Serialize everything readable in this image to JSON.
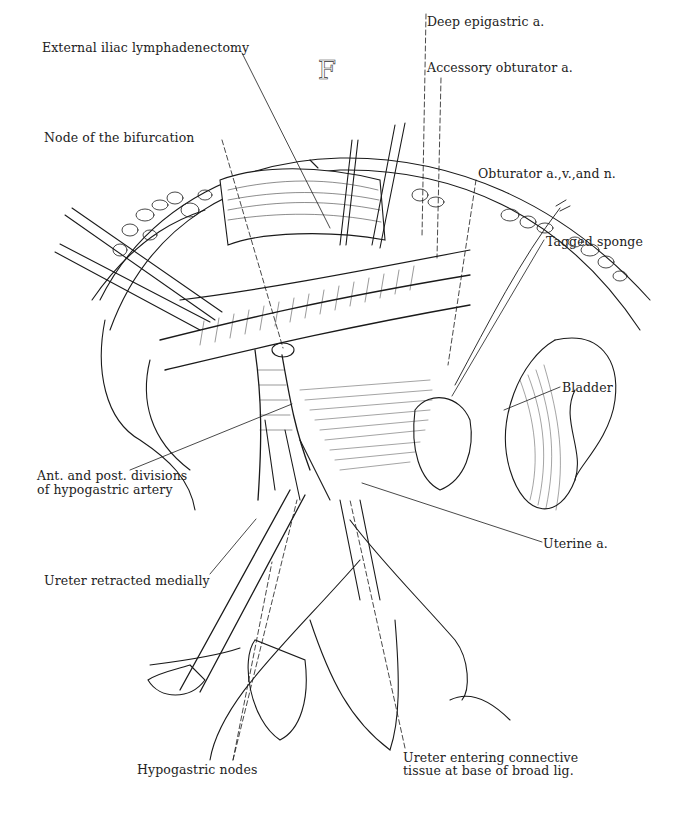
{
  "figure": {
    "panel_letter": "F",
    "labels": [
      {
        "id": "external-iliac-lymphadenectomy",
        "text": "External iliac lymphadenectomy",
        "x": 42,
        "y": 41
      },
      {
        "id": "node-of-bifurcation",
        "text": "Node of the bifurcation",
        "x": 44,
        "y": 131
      },
      {
        "id": "deep-epigastric-a",
        "text": "Deep epigastric a.",
        "x": 427,
        "y": 15
      },
      {
        "id": "accessory-obturator-a",
        "text": "Accessory obturator a.",
        "x": 427,
        "y": 61
      },
      {
        "id": "obturator-avn",
        "text": "Obturator a.,v.,and n.",
        "x": 478,
        "y": 167
      },
      {
        "id": "tagged-sponge",
        "text": "Tagged sponge",
        "x": 546,
        "y": 235
      },
      {
        "id": "bladder",
        "text": "Bladder",
        "x": 562,
        "y": 381
      },
      {
        "id": "ant-post-divisions",
        "text": "Ant. and post. divisions",
        "x": 37,
        "y": 469
      },
      {
        "id": "of-hypogastric-artery",
        "text": "of hypogastric artery",
        "x": 37,
        "y": 483
      },
      {
        "id": "uterine-a",
        "text": "Uterine a.",
        "x": 543,
        "y": 537
      },
      {
        "id": "ureter-retracted-medially",
        "text": "Ureter retracted medially",
        "x": 44,
        "y": 574
      },
      {
        "id": "hypogastric-nodes",
        "text": "Hypogastric nodes",
        "x": 137,
        "y": 763
      },
      {
        "id": "ureter-entering-1",
        "text": "Ureter entering connective",
        "x": 403,
        "y": 751
      },
      {
        "id": "ureter-entering-2",
        "text": "tissue at base of broad lig.",
        "x": 403,
        "y": 764
      }
    ],
    "leader_lines": [
      {
        "id": "ext-iliac-leader",
        "dashed": false,
        "points": [
          [
            242,
            53
          ],
          [
            330,
            228
          ]
        ]
      },
      {
        "id": "node-bifurcation-leader",
        "dashed": true,
        "points": [
          [
            222,
            140
          ],
          [
            283,
            348
          ]
        ]
      },
      {
        "id": "deep-epigastric-leader",
        "dashed": true,
        "points": [
          [
            426,
            14
          ],
          [
            422,
            237
          ]
        ]
      },
      {
        "id": "accessory-obturator-leader",
        "dashed": true,
        "points": [
          [
            441,
            78
          ],
          [
            437,
            258
          ]
        ]
      },
      {
        "id": "obturator-leader",
        "dashed": true,
        "points": [
          [
            476,
            180
          ],
          [
            448,
            365
          ]
        ]
      },
      {
        "id": "tagged-sponge-leader",
        "dashed": false,
        "points": [
          [
            544,
            240
          ],
          [
            452,
            396
          ]
        ]
      },
      {
        "id": "bladder-leader",
        "dashed": false,
        "points": [
          [
            560,
            387
          ],
          [
            504,
            410
          ]
        ]
      },
      {
        "id": "ant-post-leader",
        "dashed": false,
        "points": [
          [
            130,
            470
          ],
          [
            292,
            404
          ]
        ]
      },
      {
        "id": "uterine-leader",
        "dashed": false,
        "points": [
          [
            542,
            542
          ],
          [
            362,
            483
          ]
        ]
      },
      {
        "id": "ureter-retracted-leader",
        "dashed": false,
        "points": [
          [
            210,
            574
          ],
          [
            256,
            519
          ]
        ]
      },
      {
        "id": "hypogastric-nodes-leader-1",
        "dashed": true,
        "points": [
          [
            233,
            760
          ],
          [
            272,
            562
          ]
        ]
      },
      {
        "id": "hypogastric-nodes-leader-2",
        "dashed": true,
        "points": [
          [
            233,
            760
          ],
          [
            297,
            500
          ]
        ]
      },
      {
        "id": "ureter-entering-leader",
        "dashed": true,
        "points": [
          [
            405,
            748
          ],
          [
            350,
            500
          ]
        ]
      }
    ]
  }
}
